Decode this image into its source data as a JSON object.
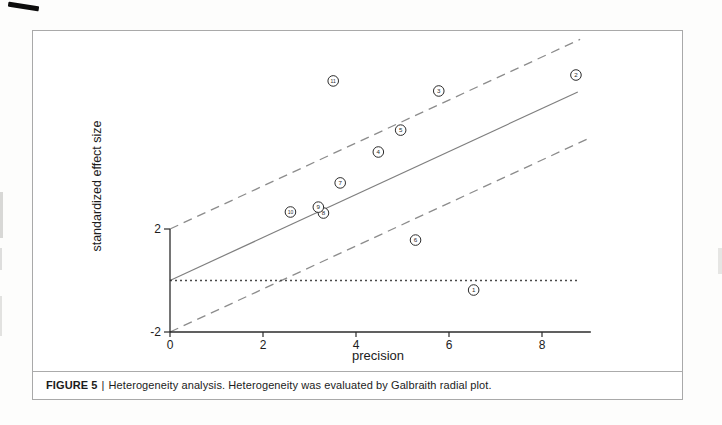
{
  "figure": {
    "caption": {
      "label": "FIGURE 5",
      "separator": "|",
      "text": "Heterogeneity analysis. Heterogeneity was evaluated by Galbraith radial plot."
    }
  },
  "chart_data": {
    "type": "scatter",
    "subtype": "galbraith-radial-plot",
    "title": "",
    "xlabel": "precision",
    "ylabel": "standardized effect size",
    "xlim": [
      0,
      9.05
    ],
    "ylim_axis": [
      -2,
      2
    ],
    "x_ticks": [
      "0",
      "2",
      "4",
      "6",
      "8"
    ],
    "y_ticks": [
      "2",
      "-2"
    ],
    "grid": false,
    "legend": false,
    "points": [
      {
        "label": "1",
        "x": 6.53,
        "y": -0.37
      },
      {
        "label": "2",
        "x": 8.73,
        "y": 7.98
      },
      {
        "label": "3",
        "x": 5.78,
        "y": 7.36
      },
      {
        "label": "4",
        "x": 4.48,
        "y": 4.99
      },
      {
        "label": "5",
        "x": 4.96,
        "y": 5.84
      },
      {
        "label": "6",
        "x": 5.28,
        "y": 1.57
      },
      {
        "label": "7",
        "x": 3.66,
        "y": 3.79
      },
      {
        "label": "8",
        "x": 3.3,
        "y": 2.62
      },
      {
        "label": "9",
        "x": 3.19,
        "y": 2.85
      },
      {
        "label": "10",
        "x": 2.59,
        "y": 2.66
      },
      {
        "label": "11",
        "x": 3.51,
        "y": 7.75
      }
    ],
    "lines": [
      {
        "name": "regression-line",
        "style": "solid",
        "slope": 0.835,
        "intercept": 0,
        "x_start": 0,
        "x_end": 8.77
      },
      {
        "name": "upper-band-line",
        "style": "dashed",
        "slope": 0.835,
        "intercept": 2,
        "x_start": 0,
        "x_end": 8.82
      },
      {
        "name": "lower-band-line",
        "style": "dashed",
        "slope": 0.835,
        "intercept": -2,
        "x_start": 0,
        "x_end": 9.05
      },
      {
        "name": "zero-reference-line",
        "style": "dotted",
        "slope": 0,
        "intercept": 0,
        "x_start": 0,
        "x_end": 8.77
      }
    ],
    "colors": {
      "solid_line": "#7f7f7f",
      "dashed_line": "#8c8c8c",
      "dotted_line": "#4a4a4a",
      "axis": "#2b2b2b",
      "point_stroke": "#2b2b2b",
      "point_fill": "#ffffff",
      "text": "#1c1c1c"
    }
  }
}
